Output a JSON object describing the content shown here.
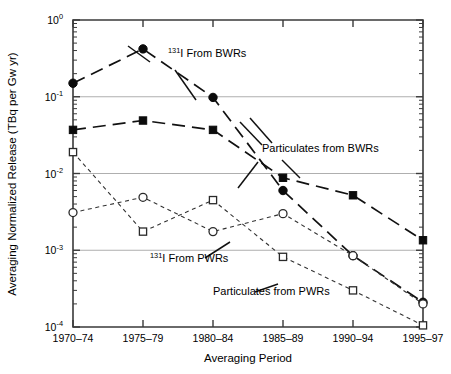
{
  "figure": {
    "name": "normalized-release-log-chart",
    "background": "#ffffff",
    "ink_color": "#111111",
    "grid_color": "#9a9a9a"
  },
  "axes": {
    "x_label": "Averaging Period",
    "y_label": "Averaging Normalized Release (TBq per Gw yr)",
    "y_tick_labels": [
      "10",
      "10",
      "10",
      "10",
      "10"
    ],
    "y_tick_exponents": [
      "0",
      "-1",
      "-2",
      "-3",
      "-4"
    ],
    "x_tick_labels": [
      "1970–74",
      "1975–79",
      "1980–84",
      "1985–89",
      "1990–94",
      "1995–97"
    ]
  },
  "annotations": [
    {
      "id": "ann-i131-bwr",
      "prefix": "131",
      "text": "I From BWRs",
      "x": 168,
      "y": 57
    },
    {
      "id": "ann-part-bwr",
      "prefix": "",
      "text": "Particulates from BWRs",
      "x": 262,
      "y": 152
    },
    {
      "id": "ann-i131-pwr",
      "prefix": "131",
      "text": "I From PWRs",
      "x": 150,
      "y": 262
    },
    {
      "id": "ann-part-pwr",
      "prefix": "",
      "text": "Particulates from PWRs",
      "x": 213,
      "y": 295
    }
  ],
  "chart_data": {
    "type": "line",
    "title": "",
    "xlabel": "Averaging Period",
    "ylabel": "Averaging Normalized Release (TBq per Gw yr)",
    "yscale": "log",
    "ylim": [
      0.0001,
      1
    ],
    "grid": true,
    "legend": "inline-annotations",
    "categories": [
      "1970–74",
      "1975–79",
      "1980–84",
      "1985–89",
      "1990–94",
      "1995–97"
    ],
    "series": [
      {
        "name": "131I From BWRs",
        "marker": "filled-circle",
        "line": "long-dash",
        "values": [
          0.15,
          0.42,
          0.098,
          0.006,
          0.00085,
          0.00021
        ]
      },
      {
        "name": "Particulates from BWRs",
        "marker": "filled-square",
        "line": "long-dash",
        "values": [
          0.037,
          0.049,
          0.037,
          0.0088,
          0.0052,
          0.00135
        ]
      },
      {
        "name": "131I From PWRs",
        "marker": "open-circle",
        "line": "short-dash",
        "values": [
          0.0031,
          0.0049,
          0.00175,
          0.003,
          0.00085,
          0.0002
        ]
      },
      {
        "name": "Particulates from PWRs",
        "marker": "open-square",
        "line": "short-dash",
        "values": [
          0.019,
          0.00175,
          0.0045,
          0.00082,
          0.0003,
          0.000105
        ]
      }
    ]
  }
}
